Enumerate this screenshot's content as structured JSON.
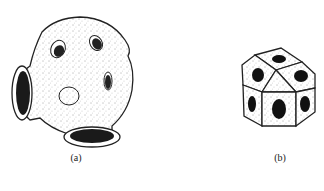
{
  "figure": {
    "panels": [
      {
        "id": "a",
        "label": "(a)",
        "description": "speckled sphere with cylindrical holes"
      },
      {
        "id": "b",
        "label": "(b)",
        "description": "faceted polyhedron with circular holes"
      }
    ]
  }
}
